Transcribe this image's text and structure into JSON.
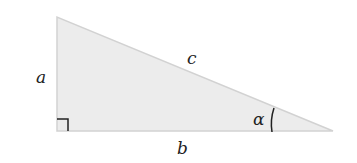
{
  "diagram": {
    "type": "right-triangle",
    "labels": {
      "side_vertical": "a",
      "side_horizontal": "b",
      "hypotenuse": "c",
      "angle": "α"
    },
    "colors": {
      "fill": "#ececec",
      "stroke": "#cfcfcf",
      "marker": "#222222",
      "text": "#222222"
    }
  }
}
